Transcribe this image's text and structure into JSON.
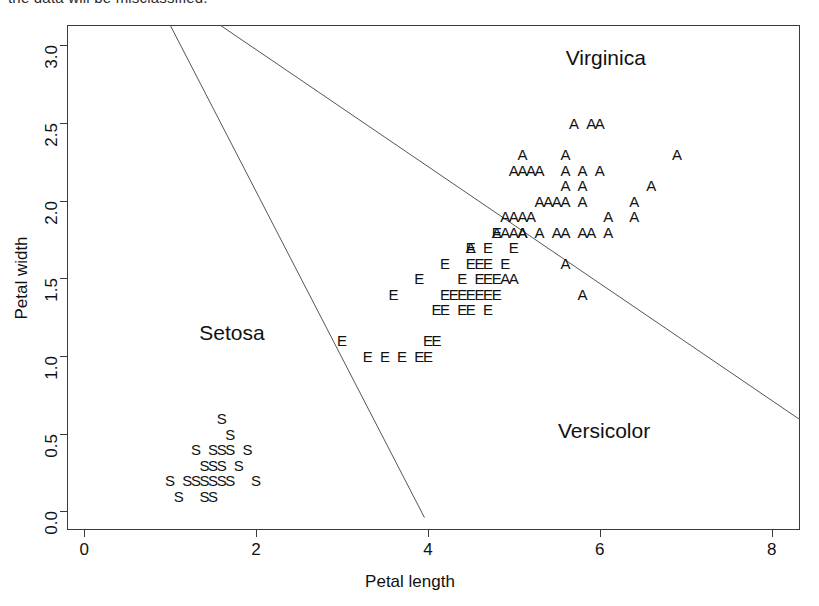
{
  "page": {
    "cropped_top_text": "the data will be misclassified."
  },
  "chart_data": {
    "type": "scatter",
    "title": "",
    "xlabel": "Petal length",
    "ylabel": "Petal width",
    "xlim": [
      -0.2,
      8.33
    ],
    "ylim": [
      -0.12,
      3.13
    ],
    "xticks": [
      0,
      2,
      4,
      6,
      8
    ],
    "yticks": [
      "0.0",
      "0.5",
      "1.0",
      "1.5",
      "2.0",
      "2.5",
      "3.0"
    ],
    "grid": false,
    "legend": "none",
    "marker_style": "text-glyph",
    "annotations": [
      {
        "text": "Setosa",
        "x": 1.72,
        "y": 1.15
      },
      {
        "text": "Versicolor",
        "x": 6.05,
        "y": 0.52
      },
      {
        "text": "Virginica",
        "x": 6.07,
        "y": 2.92
      }
    ],
    "decision_boundaries": [
      {
        "name": "setosa-versicolor-boundary",
        "x1": 1.0,
        "y1": 3.13,
        "x2": 3.96,
        "y2": -0.04
      },
      {
        "name": "versicolor-virginica-boundary",
        "x1": 1.58,
        "y1": 3.13,
        "x2": 8.33,
        "y2": 0.59
      }
    ],
    "series": [
      {
        "name": "Setosa",
        "marker": "S",
        "points": [
          [
            1.6,
            0.6
          ],
          [
            1.7,
            0.5
          ],
          [
            1.3,
            0.4
          ],
          [
            1.5,
            0.4
          ],
          [
            1.6,
            0.4
          ],
          [
            1.7,
            0.4
          ],
          [
            1.9,
            0.4
          ],
          [
            1.4,
            0.3
          ],
          [
            1.5,
            0.3
          ],
          [
            1.6,
            0.3
          ],
          [
            1.8,
            0.3
          ],
          [
            1.0,
            0.2
          ],
          [
            1.2,
            0.2
          ],
          [
            1.3,
            0.2
          ],
          [
            1.4,
            0.2
          ],
          [
            1.5,
            0.2
          ],
          [
            1.6,
            0.2
          ],
          [
            1.7,
            0.2
          ],
          [
            2.0,
            0.2
          ],
          [
            1.1,
            0.1
          ],
          [
            1.4,
            0.1
          ],
          [
            1.5,
            0.1
          ]
        ]
      },
      {
        "name": "Versicolor",
        "marker": "E",
        "points": [
          [
            4.8,
            1.8
          ],
          [
            4.5,
            1.7
          ],
          [
            4.7,
            1.7
          ],
          [
            5.0,
            1.7
          ],
          [
            4.2,
            1.6
          ],
          [
            4.5,
            1.6
          ],
          [
            4.6,
            1.6
          ],
          [
            4.7,
            1.6
          ],
          [
            4.9,
            1.6
          ],
          [
            3.9,
            1.5
          ],
          [
            4.4,
            1.5
          ],
          [
            4.6,
            1.5
          ],
          [
            4.7,
            1.5
          ],
          [
            4.8,
            1.5
          ],
          [
            3.6,
            1.4
          ],
          [
            4.2,
            1.4
          ],
          [
            4.3,
            1.4
          ],
          [
            4.4,
            1.4
          ],
          [
            4.5,
            1.4
          ],
          [
            4.6,
            1.4
          ],
          [
            4.7,
            1.4
          ],
          [
            4.8,
            1.4
          ],
          [
            4.1,
            1.3
          ],
          [
            4.2,
            1.3
          ],
          [
            4.4,
            1.3
          ],
          [
            4.5,
            1.3
          ],
          [
            4.7,
            1.3
          ],
          [
            3.0,
            1.1
          ],
          [
            4.0,
            1.1
          ],
          [
            4.1,
            1.1
          ],
          [
            3.3,
            1.0
          ],
          [
            3.5,
            1.0
          ],
          [
            3.7,
            1.0
          ],
          [
            3.9,
            1.0
          ],
          [
            4.0,
            1.0
          ]
        ]
      },
      {
        "name": "Virginica",
        "marker": "A",
        "points": [
          [
            5.7,
            2.5
          ],
          [
            5.9,
            2.5
          ],
          [
            6.0,
            2.5
          ],
          [
            5.1,
            2.3
          ],
          [
            5.6,
            2.3
          ],
          [
            6.9,
            2.3
          ],
          [
            5.0,
            2.2
          ],
          [
            5.1,
            2.2
          ],
          [
            5.2,
            2.2
          ],
          [
            5.3,
            2.2
          ],
          [
            5.6,
            2.2
          ],
          [
            5.8,
            2.2
          ],
          [
            6.0,
            2.2
          ],
          [
            5.6,
            2.1
          ],
          [
            5.8,
            2.1
          ],
          [
            6.6,
            2.1
          ],
          [
            5.3,
            2.0
          ],
          [
            5.4,
            2.0
          ],
          [
            5.5,
            2.0
          ],
          [
            5.6,
            2.0
          ],
          [
            5.8,
            2.0
          ],
          [
            6.4,
            2.0
          ],
          [
            4.9,
            1.9
          ],
          [
            5.0,
            1.9
          ],
          [
            5.1,
            1.9
          ],
          [
            5.2,
            1.9
          ],
          [
            6.1,
            1.9
          ],
          [
            6.4,
            1.9
          ],
          [
            5.0,
            1.8
          ],
          [
            5.1,
            1.8
          ],
          [
            5.3,
            1.8
          ],
          [
            5.9,
            1.8
          ],
          [
            4.8,
            1.8
          ],
          [
            4.9,
            1.8
          ],
          [
            5.1,
            1.8
          ],
          [
            5.5,
            1.8
          ],
          [
            5.6,
            1.8
          ],
          [
            5.8,
            1.8
          ],
          [
            6.1,
            1.8
          ],
          [
            4.5,
            1.7
          ],
          [
            5.6,
            1.6
          ],
          [
            4.9,
            1.5
          ],
          [
            5.0,
            1.5
          ],
          [
            5.8,
            1.4
          ]
        ]
      }
    ]
  }
}
